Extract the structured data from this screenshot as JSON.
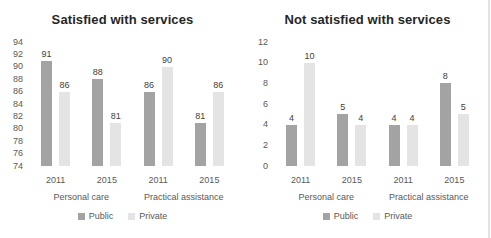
{
  "chart_data": [
    {
      "type": "bar",
      "title": "Satisfied with services",
      "categories": [
        "2011",
        "2015",
        "2011",
        "2015"
      ],
      "group_labels": [
        "Personal care",
        "Practical assistance"
      ],
      "series": [
        {
          "name": "Public",
          "color": "#a3a3a3",
          "values": [
            91,
            88,
            86,
            81
          ]
        },
        {
          "name": "Private",
          "color": "#e4e4e4",
          "values": [
            86,
            81,
            90,
            86
          ]
        }
      ],
      "ylim": [
        74,
        94
      ],
      "yticks": [
        94,
        92,
        90,
        88,
        86,
        84,
        82,
        80,
        78,
        76,
        74
      ],
      "grid": false,
      "legend_position": "bottom"
    },
    {
      "type": "bar",
      "title": "Not satisfied with services",
      "categories": [
        "2011",
        "2015",
        "2011",
        "2015"
      ],
      "group_labels": [
        "Personal care",
        "Practical assistance"
      ],
      "series": [
        {
          "name": "Public",
          "color": "#a3a3a3",
          "values": [
            4,
            5,
            4,
            8
          ]
        },
        {
          "name": "Private",
          "color": "#e4e4e4",
          "values": [
            10,
            4,
            4,
            5
          ]
        }
      ],
      "ylim": [
        0,
        12
      ],
      "yticks": [
        12,
        10,
        8,
        6,
        4,
        2,
        0
      ],
      "grid": false,
      "legend_position": "bottom"
    }
  ],
  "colors": {
    "title_text": "#262626",
    "axis_text": "#595959",
    "value_label_text": "#404040",
    "public_bar": "#a3a3a3",
    "private_bar": "#e4e4e4",
    "page_edge": "#e2e2e2"
  }
}
